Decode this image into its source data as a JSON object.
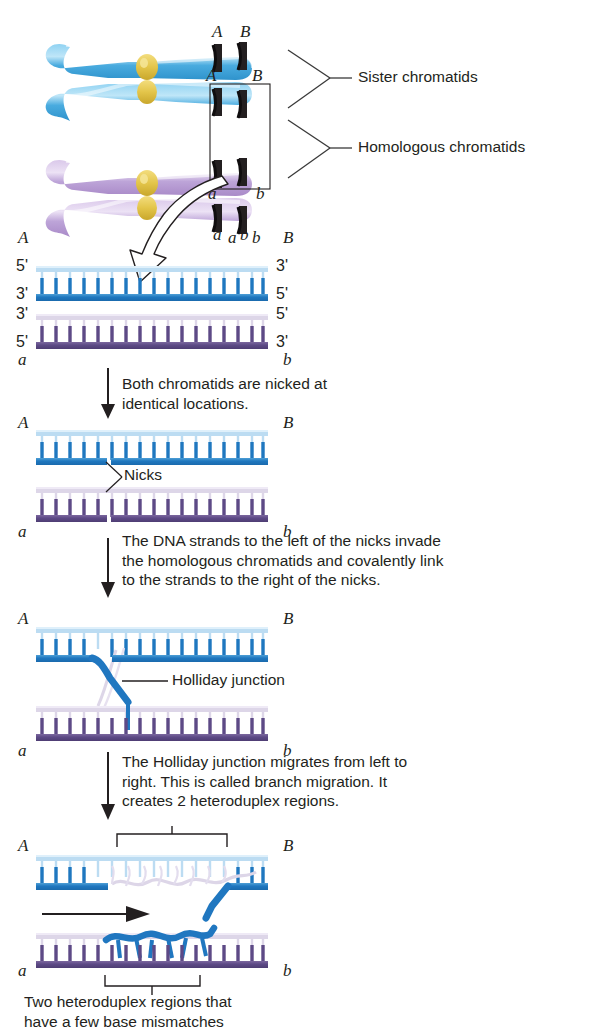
{
  "figure": {
    "background": "#ffffff",
    "colors": {
      "blue_backbone": "#2077c0",
      "blue_light": "#bcdcf2",
      "purple_backbone": "#5d4a86",
      "purple_light": "#d9d2e6",
      "chromosome_blue": "#56b2e3",
      "chromosome_purple": "#c0a8d8",
      "centromere": "#e0c040",
      "band_dark": "#231f20",
      "ink": "#231f20"
    }
  },
  "chromosome_panel": {
    "gene_labels": {
      "A": "A",
      "B": "B",
      "a": "a",
      "b": "b"
    },
    "top_pair_labels": [
      "A",
      "B"
    ],
    "second_pair_labels": [
      "A",
      "B"
    ],
    "third_pair_labels": [
      "a",
      "b"
    ],
    "bottom_pair_labels": [
      "a",
      "b"
    ],
    "brace_labels": [
      {
        "text": "Sister chromatids"
      },
      {
        "text": "Homologous chromatids"
      }
    ]
  },
  "panels": [
    {
      "id": "panel-1",
      "left_top_label": "A",
      "right_top_label": "B",
      "left_bottom_label": "a",
      "right_bottom_label": "b",
      "mid_labels": [
        "a",
        "b"
      ],
      "primes": {
        "blue_top_left": "5'",
        "blue_top_right": "3'",
        "blue_bot_left": "3'",
        "blue_bot_right": "5'",
        "purple_top_left": "3'",
        "purple_top_right": "5'",
        "purple_bot_left": "5'",
        "purple_bot_right": "3'"
      }
    },
    {
      "id": "panel-2",
      "left_top_label": "A",
      "right_top_label": "B",
      "left_bottom_label": "a",
      "right_bottom_label": "b",
      "annotation": "Nicks"
    },
    {
      "id": "panel-3",
      "left_top_label": "A",
      "right_top_label": "B",
      "left_bottom_label": "a",
      "right_bottom_label": "b",
      "annotation": "Holliday junction"
    },
    {
      "id": "panel-4",
      "left_top_label": "A",
      "right_top_label": "B",
      "left_bottom_label": "a",
      "right_bottom_label": "b"
    }
  ],
  "step_captions": [
    {
      "id": "step-1",
      "text": "Both chromatids are nicked at\nidentical locations."
    },
    {
      "id": "step-2",
      "text": "The DNA strands to the left of the nicks invade\nthe homologous chromatids and covalently link\nto the strands to the right of the nicks."
    },
    {
      "id": "step-3",
      "text": "The Holliday junction migrates from left to\nright. This is called branch migration. It\ncreates 2 heteroduplex regions."
    }
  ],
  "footer_caption": {
    "id": "footer",
    "text": "Two heteroduplex regions that\nhave a few base mismatches"
  }
}
